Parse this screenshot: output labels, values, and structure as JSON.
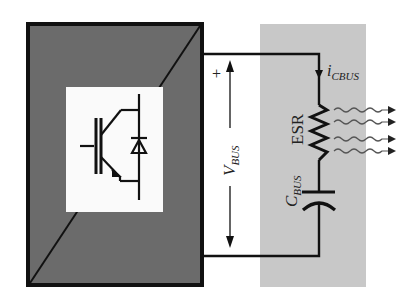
{
  "diagram": {
    "title": "",
    "colors": {
      "background": "#ffffff",
      "converter_fill": "#6b6b6b",
      "converter_stroke": "#111111",
      "capacitor_region": "#c8c8c8",
      "wire": "#111111",
      "heat_waves": "#555555"
    },
    "converter": {
      "name": "Power converter block",
      "symbol": "IGBT with antiparallel diode"
    },
    "labels": {
      "plus_sign": "+",
      "vbus_main": "V",
      "vbus_sub": "BUS",
      "icbus_main": "i",
      "icbus_sub": "CBUS",
      "esr": "ESR",
      "cbus_main": "C",
      "cbus_sub": "BUS"
    },
    "components": [
      {
        "type": "resistor",
        "label": "ESR"
      },
      {
        "type": "capacitor",
        "label": "C_BUS"
      },
      {
        "type": "heat_dissipation",
        "arrows": 4
      }
    ]
  }
}
